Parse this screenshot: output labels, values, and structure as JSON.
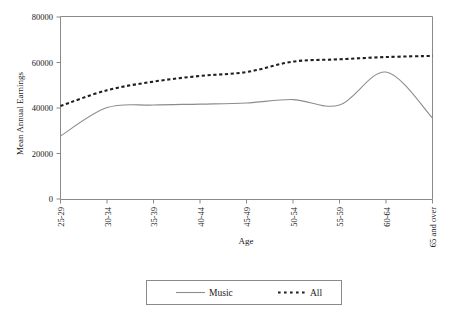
{
  "chart_data": {
    "type": "line",
    "title": "",
    "xlabel": "Age",
    "ylabel": "Mean Annual Earnings",
    "categories": [
      "25-29",
      "30-34",
      "35-39",
      "40-44",
      "45-49",
      "50-54",
      "55-59",
      "60-64",
      "65 and over"
    ],
    "ylim": [
      0,
      80000
    ],
    "yticks": [
      0,
      20000,
      40000,
      60000,
      80000
    ],
    "ytick_labels": [
      "0",
      "20000",
      "40000",
      "60000",
      "80000"
    ],
    "grid": false,
    "legend_position": "bottom",
    "series": [
      {
        "name": "Music",
        "style": "solid",
        "color": "#8c8c8c",
        "values": [
          27700,
          40200,
          41300,
          41700,
          42200,
          43700,
          41300,
          55800,
          35600
        ]
      },
      {
        "name": "All",
        "style": "dotted",
        "color": "#1f1f1f",
        "values": [
          40900,
          47800,
          51600,
          54100,
          55800,
          60400,
          61400,
          62400,
          62900
        ]
      }
    ],
    "annotations": []
  },
  "legend": {
    "entries": [
      {
        "label": "Music",
        "style": "solid"
      },
      {
        "label": "All",
        "style": "dotted"
      }
    ]
  },
  "axes": {
    "y_title": "Mean Annual Earnings",
    "x_title": "Age"
  }
}
